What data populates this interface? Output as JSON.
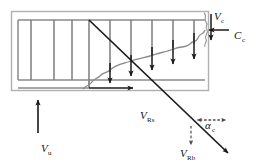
{
  "figure": {
    "type": "free-body-diagram",
    "title": "",
    "colors": {
      "stroke_dark": "#1a1a1a",
      "stroke_gray": "#8a8a8a",
      "stroke_light": "#b5b5b5",
      "background": "#ffffff"
    },
    "labels": [
      {
        "id": "v-c",
        "symbol": "V",
        "subscript": "c",
        "x": 214,
        "y": 16,
        "arrow": "down",
        "meaning": "vertical-concrete-shear-force"
      },
      {
        "id": "c-c",
        "symbol": "C",
        "subscript": "c",
        "x": 233,
        "y": 34,
        "arrow": "left",
        "meaning": "concrete-compression-force"
      },
      {
        "id": "v-u",
        "symbol": "V",
        "subscript": "u",
        "x": 41,
        "y": 150,
        "arrow": "up",
        "meaning": "ultimate-applied-shear"
      },
      {
        "id": "v-rs",
        "symbol": "V",
        "subscript": "Rs",
        "x": 142,
        "y": 117,
        "arrow": "none",
        "meaning": "steel-resisting-force"
      },
      {
        "id": "v-rb",
        "symbol": "V",
        "subscript": "Rb",
        "x": 184,
        "y": 155,
        "arrow": "down",
        "meaning": "bar-resisting-force"
      },
      {
        "id": "alpha-c",
        "symbol": "α",
        "subscript": "c",
        "x": 211,
        "y": 126,
        "arrow": "right",
        "meaning": "crack-inclination-angle"
      }
    ],
    "geometry": {
      "outer_box": {
        "x": 11,
        "y": 11,
        "width": 198,
        "height": 80
      },
      "inner_panel": {
        "x": 18,
        "y": 19,
        "width": 187,
        "height": 61
      },
      "vertical_bar_count": 8,
      "load_arrow_count": 6,
      "diagonal_crack": {
        "x1": 89,
        "y1": 20,
        "x2": 227,
        "y2": 152
      },
      "wavy_profile": "descending-left",
      "base_arrow": {
        "x1": 89,
        "y1": 88,
        "x2": 131,
        "y2": 88,
        "direction": "right"
      }
    }
  }
}
